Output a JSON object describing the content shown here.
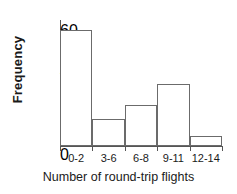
{
  "chart_data": {
    "type": "bar",
    "title": "",
    "xlabel": "Number of round-trip flights",
    "ylabel": "Frequency",
    "categories": [
      "0-2",
      "3-6",
      "6-8",
      "9-11",
      "12-14"
    ],
    "values": [
      56,
      13,
      20,
      30,
      5
    ],
    "yticks": [
      0,
      10,
      20,
      30,
      40,
      50,
      60
    ],
    "ylim": [
      0,
      60
    ],
    "grid": false,
    "legend": null,
    "bar_fill_color": "#ffffff",
    "bar_edge_color": "#6b6b6b",
    "axis_color": "#555555",
    "text_color": "#1a1a1a",
    "background_color": "#ffffff"
  }
}
